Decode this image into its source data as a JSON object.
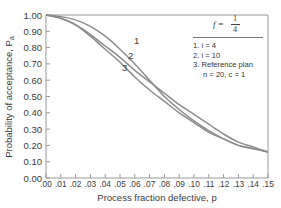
{
  "chart_data": {
    "type": "line",
    "title": "",
    "xlabel": "Process fraction defective, p",
    "ylabel": "Probability of acceptance, Pa",
    "xlim": [
      0.0,
      0.15
    ],
    "ylim": [
      0.0,
      1.0
    ],
    "x_ticks": [
      ".00",
      ".01",
      ".02",
      ".03",
      ".04",
      ".05",
      ".06",
      ".07",
      ".08",
      ".09",
      ".10",
      ".11",
      ".12",
      ".13",
      ".14",
      ".15"
    ],
    "y_ticks": [
      "0.00",
      "0.10",
      "0.20",
      "0.30",
      "0.40",
      "0.50",
      "0.60",
      "0.70",
      "0.80",
      "0.90",
      "1.00"
    ],
    "grid": false,
    "legend_position": "top-right",
    "annotation": "f = 1/4",
    "x": [
      0.0,
      0.01,
      0.02,
      0.03,
      0.04,
      0.05,
      0.06,
      0.07,
      0.08,
      0.09,
      0.1,
      0.11,
      0.12,
      0.13,
      0.14,
      0.15
    ],
    "series": [
      {
        "name": "1. i = 4",
        "values": [
          1.0,
          0.99,
          0.97,
          0.93,
          0.87,
          0.79,
          0.7,
          0.6,
          0.5,
          0.42,
          0.35,
          0.29,
          0.24,
          0.2,
          0.18,
          0.16
        ]
      },
      {
        "name": "2. i = 10",
        "values": [
          1.0,
          0.98,
          0.94,
          0.87,
          0.79,
          0.71,
          0.62,
          0.54,
          0.47,
          0.4,
          0.34,
          0.28,
          0.24,
          0.2,
          0.18,
          0.16
        ]
      },
      {
        "name": "3. Reference plan n = 20, c = 1",
        "values": [
          1.0,
          0.98,
          0.94,
          0.88,
          0.81,
          0.74,
          0.66,
          0.59,
          0.52,
          0.45,
          0.39,
          0.33,
          0.27,
          0.22,
          0.19,
          0.16
        ]
      }
    ]
  },
  "legend": {
    "f_label": "f =",
    "f_num": "1",
    "f_den": "4",
    "items": [
      "1. i = 4",
      "2. i = 10",
      "3. Reference plan"
    ],
    "item3_sub": "n = 20, c = 1"
  },
  "curve_labels": [
    "1",
    "2",
    "3"
  ],
  "axes": {
    "xlabel": "Process fraction defective, p",
    "ylabel": "Probability of acceptance, P",
    "ylabel_sub": "a"
  }
}
